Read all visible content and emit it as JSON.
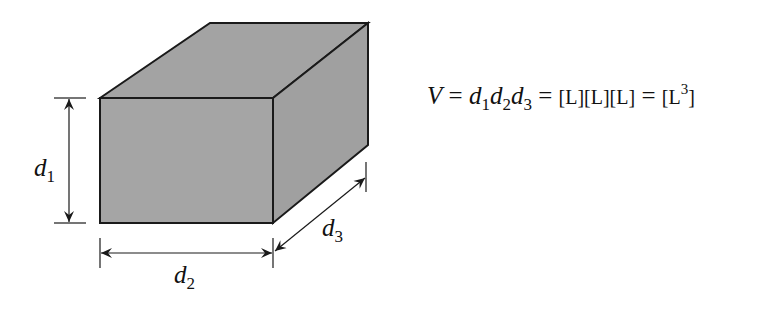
{
  "diagram": {
    "type": "rectangular-prism-dimensions",
    "fill_color": "#a3a3a3",
    "stroke_color": "#1a1a1a",
    "labels": {
      "d1": {
        "base": "d",
        "sub": "1"
      },
      "d2": {
        "base": "d",
        "sub": "2"
      },
      "d3": {
        "base": "d",
        "sub": "3"
      }
    }
  },
  "equation": {
    "lhs": "V",
    "eq1": "=",
    "terms": [
      {
        "base": "d",
        "sub": "1"
      },
      {
        "base": "d",
        "sub": "2"
      },
      {
        "base": "d",
        "sub": "3"
      }
    ],
    "eq2": "=",
    "units_product": "[L][L][L]",
    "eq3": "=",
    "result_open": "[L",
    "result_exp": "3",
    "result_close": "]"
  }
}
